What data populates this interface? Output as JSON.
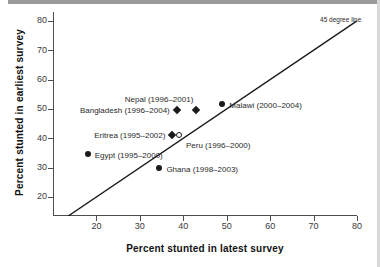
{
  "chart_data": {
    "type": "scatter",
    "title": "",
    "xlabel": "Percent stunted in latest survey",
    "ylabel": "Percent stunted in earliest survey",
    "xlim": [
      10,
      80
    ],
    "ylim": [
      13.5,
      83
    ],
    "xticks": [
      "20",
      "30",
      "40",
      "50",
      "60",
      "70",
      "80"
    ],
    "yticks": [
      "20",
      "30",
      "40",
      "50",
      "60",
      "70",
      "80"
    ],
    "grid": false,
    "legend": "none",
    "annotations": [
      {
        "name": "reference-line-label",
        "text": "45 degree line"
      }
    ],
    "reference_line": {
      "name": "45-degree-line",
      "from": [
        13.5,
        13.5
      ],
      "to": [
        80,
        80
      ]
    },
    "points": [
      {
        "label": "Bangladesh (1996–2004)",
        "x": 38.5,
        "y": 49.5,
        "marker": "diamond",
        "label_pos": "left"
      },
      {
        "label": "Nepal (1996–2001)",
        "x": 43.0,
        "y": 49.5,
        "marker": "diamond",
        "label_pos": "above-left"
      },
      {
        "label": "Malawi (2000–2004)",
        "x": 49.0,
        "y": 51.5,
        "marker": "circle",
        "label_pos": "right"
      },
      {
        "label": "Eritrea (1995–2002)",
        "x": 37.5,
        "y": 41.0,
        "marker": "diamond",
        "label_pos": "left"
      },
      {
        "label": "Peru (1996–2000)",
        "x": 39.0,
        "y": 41.0,
        "marker": "circle-open",
        "label_pos": "below-right"
      },
      {
        "label": "Egypt (1995–2000)",
        "x": 18.0,
        "y": 34.5,
        "marker": "circle",
        "label_pos": "right"
      },
      {
        "label": "Ghana (1998–2003)",
        "x": 34.5,
        "y": 30.0,
        "marker": "circle",
        "label_pos": "right"
      }
    ]
  },
  "colors": {
    "marker": "#1a1a1a",
    "axis": "#4d4d4d",
    "text": "#2b2b2b",
    "title": "#111111",
    "background": "#ffffff",
    "top_rule": "#9a9a9a"
  }
}
